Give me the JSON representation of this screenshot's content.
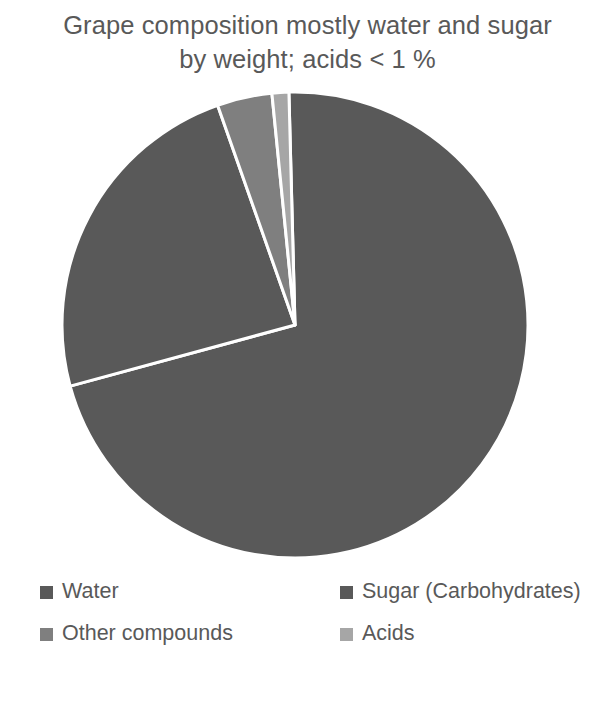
{
  "chart_data": {
    "type": "pie",
    "title": "Grape composition mostly water and sugar\nby weight; acids < 1 %",
    "title_line_1": "Grape composition mostly water and sugar",
    "title_line_2": "by weight; acids < 1 %",
    "xlabel": "",
    "ylabel": "",
    "grid": false,
    "legend_position": "bottom",
    "data_labels_shown": false,
    "start_angle_deg": 358.5,
    "direction": "clockwise",
    "categories": [
      "Water",
      "Sugar (Carbohydrates)",
      "Other compounds",
      "Acids"
    ],
    "values": [
      71.2,
      23.8,
      3.8,
      1.2
    ],
    "units": "percent by weight",
    "slices": [
      {
        "label": "Water",
        "value": 71.2,
        "color": "#595959",
        "start_angle_deg": 358.5,
        "end_angle_deg": 254.8,
        "sweep_deg": 256.3
      },
      {
        "label": "Sugar (Carbohydrates)",
        "value": 23.8,
        "color": "#595959",
        "start_angle_deg": 254.8,
        "end_angle_deg": 340.6,
        "sweep_deg": 85.8
      },
      {
        "label": "Other compounds",
        "value": 3.8,
        "color": "#7f7f7f",
        "start_angle_deg": 340.6,
        "end_angle_deg": 354.3,
        "sweep_deg": 13.7
      },
      {
        "label": "Acids",
        "value": 1.2,
        "color": "#a6a6a6",
        "start_angle_deg": 354.3,
        "end_angle_deg": 358.5,
        "sweep_deg": 4.2
      }
    ]
  },
  "legend": {
    "entries": [
      {
        "label": "Water",
        "color": "#595959"
      },
      {
        "label": "Sugar (Carbohydrates)",
        "color": "#595959"
      },
      {
        "label": "Other compounds",
        "color": "#7f7f7f"
      },
      {
        "label": "Acids",
        "color": "#a6a6a6"
      }
    ]
  },
  "geometry": {
    "center_x": 295,
    "center_y": 325,
    "radius": 233,
    "separator_color": "#ffffff",
    "separator_width": 3
  },
  "colors": {
    "background": "#ffffff",
    "text": "#595959",
    "series_dark": "#595959",
    "series_medium": "#7f7f7f",
    "series_light": "#a6a6a6"
  }
}
